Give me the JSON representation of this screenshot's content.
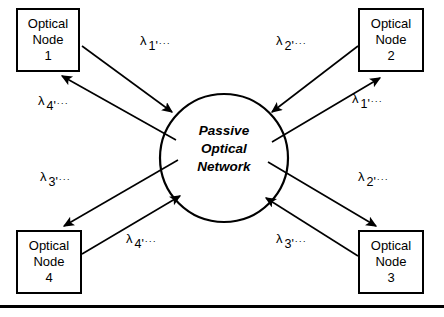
{
  "figure": {
    "type": "network-diagram",
    "width": 444,
    "height": 317,
    "background_color": "#ffffff",
    "line_color": "#000000"
  },
  "hub": {
    "shape": "circle",
    "line1": "Passive",
    "line2": "Optical",
    "line3": "Network"
  },
  "nodes": [
    {
      "id": "node-1",
      "line1": "Optical",
      "line2": "Node",
      "line3": "1",
      "position": "top-left"
    },
    {
      "id": "node-2",
      "line1": "Optical",
      "line2": "Node",
      "line3": "2",
      "position": "top-right"
    },
    {
      "id": "node-3",
      "line1": "Optical",
      "line2": "Node",
      "line3": "3",
      "position": "bottom-right"
    },
    {
      "id": "node-4",
      "line1": "Optical",
      "line2": "Node",
      "line3": "4",
      "position": "bottom-left"
    }
  ],
  "labels": [
    {
      "id": "lbl-n1-out",
      "symbol": "λ",
      "sub": "1'",
      "dots": "···",
      "edge": "node-1-to-hub"
    },
    {
      "id": "lbl-n1-in",
      "symbol": "λ",
      "sub": "4'",
      "dots": "···",
      "edge": "hub-to-node-1"
    },
    {
      "id": "lbl-n2-in",
      "symbol": "λ",
      "sub": "2'",
      "dots": "···",
      "edge": "node-2-to-hub"
    },
    {
      "id": "lbl-n2-out",
      "symbol": "λ",
      "sub": "1'",
      "dots": "···",
      "edge": "hub-to-node-2"
    },
    {
      "id": "lbl-n4-in",
      "symbol": "λ",
      "sub": "3'",
      "dots": "···",
      "edge": "hub-to-node-4"
    },
    {
      "id": "lbl-n4-out",
      "symbol": "λ",
      "sub": "4'",
      "dots": "···",
      "edge": "node-4-to-hub"
    },
    {
      "id": "lbl-n3-out",
      "symbol": "λ",
      "sub": "2'",
      "dots": "···",
      "edge": "hub-to-node-3"
    },
    {
      "id": "lbl-n3-in",
      "symbol": "λ",
      "sub": "3'",
      "dots": "···",
      "edge": "node-3-to-hub"
    }
  ],
  "footer_rule": {
    "visible": true,
    "thickness": 3
  }
}
